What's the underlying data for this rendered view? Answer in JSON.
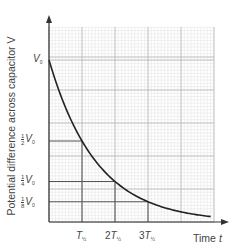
{
  "chart_data": {
    "type": "line",
    "title": "",
    "xlabel": "Time t",
    "ylabel": "Potential difference across capacitor V",
    "grid": true,
    "legend": null,
    "x_unit": "T_half",
    "x": [
      0,
      0.5,
      1,
      1.5,
      2,
      2.5,
      3,
      3.5,
      4,
      4.5,
      4.9
    ],
    "y": [
      1,
      0.707,
      0.5,
      0.354,
      0.25,
      0.177,
      0.125,
      0.088,
      0.0625,
      0.044,
      0.033
    ],
    "series": [
      {
        "name": "V = V0 * (1/2)^(t/T_half)",
        "x": [
          0,
          0.5,
          1,
          1.5,
          2,
          2.5,
          3,
          3.5,
          4,
          4.5,
          4.9
        ],
        "values": [
          1,
          0.707,
          0.5,
          0.354,
          0.25,
          0.177,
          0.125,
          0.088,
          0.0625,
          0.044,
          0.033
        ]
      }
    ],
    "xticks": [
      "T½",
      "2T½",
      "3T½"
    ],
    "xtick_values": [
      1,
      2,
      3
    ],
    "yticks": [
      "V0",
      "½V0",
      "¼V0",
      "⅛V0"
    ],
    "ytick_values": [
      1,
      0.5,
      0.25,
      0.125
    ],
    "guide_lines": [
      {
        "y": 0.5,
        "x": 1
      },
      {
        "y": 0.25,
        "x": 2
      },
      {
        "y": 0.125,
        "x": 3
      }
    ],
    "xlim": [
      0,
      5
    ],
    "ylim": [
      0,
      1.2
    ],
    "colors": {
      "curve": "#222222",
      "grid_major": "#b5b5b5",
      "grid_minor": "#e3e3e3",
      "axis": "#333333",
      "guide": "#555555"
    }
  },
  "labels": {
    "ylabel": "Potential difference across capacitor V",
    "xlabel_text": "Time",
    "xlabel_var": "t",
    "v0": "V",
    "v0_sub": "0",
    "half_n": "1",
    "half_d": "2",
    "quarter_n": "1",
    "quarter_d": "4",
    "eighth_n": "1",
    "eighth_d": "8",
    "t_var": "T",
    "t_sub": "½",
    "two": "2",
    "three": "3"
  }
}
